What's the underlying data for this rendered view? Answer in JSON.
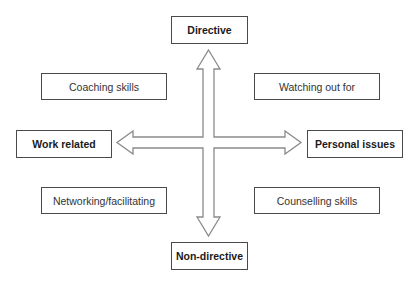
{
  "diagram": {
    "axes": {
      "top": "Directive",
      "bottom": "Non-directive",
      "left": "Work related",
      "right": "Personal issues"
    },
    "quadrants": {
      "top_left": "Coaching skills",
      "top_right": "Watching out for",
      "bottom_left": "Networking/facilitating",
      "bottom_right": "Counselling skills"
    },
    "colors": {
      "box_border": "#4a4a4a",
      "arrow_stroke": "#8a8a8a",
      "background": "#ffffff"
    }
  }
}
